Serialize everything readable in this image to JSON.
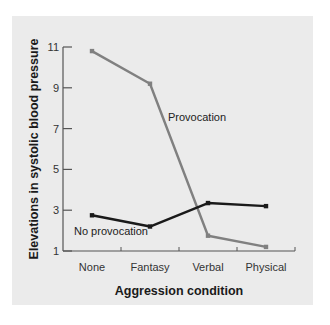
{
  "chart_data": {
    "type": "line",
    "title": "",
    "xlabel": "Aggression condition",
    "ylabel": "Elevations in systolic blood pressure",
    "categories": [
      "None",
      "Fantasy",
      "Verbal",
      "Physical"
    ],
    "yticks": [
      1,
      3,
      5,
      7,
      9,
      11
    ],
    "ylim": [
      1,
      11
    ],
    "grid": false,
    "legend": "inline labels",
    "series": [
      {
        "name": "Provocation",
        "color": "#808080",
        "values": [
          10.8,
          9.2,
          1.75,
          1.2
        ]
      },
      {
        "name": "No provocation",
        "color": "#1a1a1a",
        "values": [
          2.75,
          2.2,
          3.35,
          3.2
        ]
      }
    ]
  }
}
